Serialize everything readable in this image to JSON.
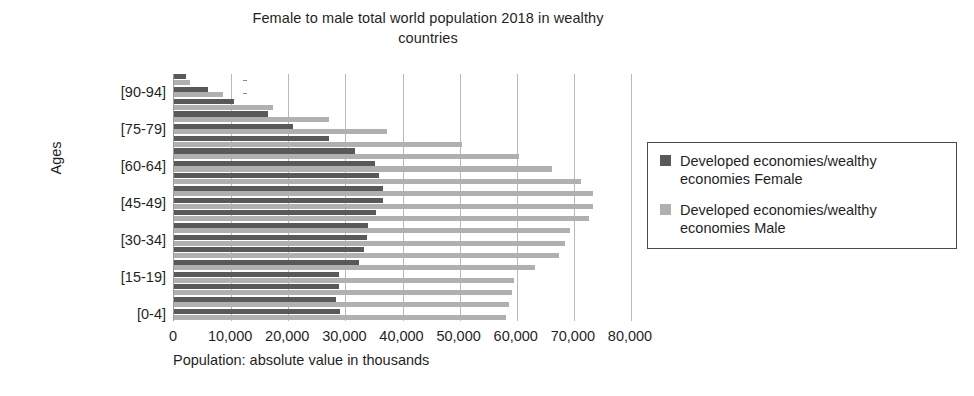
{
  "chart_data": {
    "type": "bar",
    "orientation": "horizontal",
    "title": "Female to male total world population 2018 in wealthy countries",
    "xlabel": "Population: absolute value in thousands",
    "ylabel": "Ages",
    "xlim": [
      0,
      80000
    ],
    "xticks": [
      0,
      10000,
      20000,
      30000,
      40000,
      50000,
      60000,
      70000,
      80000
    ],
    "xticklabels": [
      "0",
      "10,000",
      "20,000",
      "30,000",
      "40,000",
      "50,000",
      "60,000",
      "70,000",
      "80,000"
    ],
    "grid": "vertical",
    "legend_position": "right",
    "categories": [
      "[95-99]",
      "[90-94]",
      "[85-89]",
      "[80-84]",
      "[75-79]",
      "[70-74]",
      "[65-69]",
      "[60-64]",
      "[55-59]",
      "[50-54]",
      "[45-49]",
      "[40-44]",
      "[35-39]",
      "[30-34]",
      "[25-29]",
      "[20-24]",
      "[15-19]",
      "[10-14]",
      "[5-9]",
      "[0-4]"
    ],
    "visible_ytick_labels": [
      "[90-94]",
      "[75-79]",
      "[60-64]",
      "[45-49]",
      "[30-34]",
      "[15-19]",
      "[0-4]"
    ],
    "series": [
      {
        "name": "Developed economies/wealthy economies Female",
        "color": "#595959",
        "values": [
          2100,
          6000,
          10500,
          16500,
          20900,
          27200,
          31600,
          35100,
          35800,
          36500,
          36500,
          35300,
          34000,
          33700,
          33300,
          32300,
          28800,
          28800,
          28400,
          29100
        ]
      },
      {
        "name": "Developed economies/wealthy economies Male",
        "color": "#b0b0b0",
        "values": [
          2800,
          8600,
          17400,
          27200,
          37200,
          50400,
          60400,
          66100,
          71200,
          73300,
          73300,
          72600,
          69300,
          68400,
          67400,
          63200,
          59600,
          59100,
          58600,
          58200
        ]
      }
    ]
  },
  "title": {
    "line1": "Female to male total world population 2018 in wealthy",
    "line2": "countries",
    "full": "Female to male total world population 2018 in wealthy countries"
  },
  "axes": {
    "y_title": "Ages",
    "x_title": "Population: absolute value in thousands"
  },
  "legend": {
    "entries": [
      {
        "label_line1": "Developed economies/wealthy",
        "label_line2": "economies Female",
        "label": "Developed economies/wealthy economies Female",
        "color": "#595959"
      },
      {
        "label_line1": "Developed economies/wealthy",
        "label_line2": "economies Male",
        "label": "Developed economies/wealthy economies Male",
        "color": "#b0b0b0"
      }
    ]
  }
}
